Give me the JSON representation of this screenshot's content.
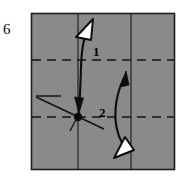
{
  "figure": {
    "step_number": "6",
    "paper": {
      "fill_color": "#8a8a8a",
      "border_color": "#1a1a1a",
      "x": 31,
      "y": 13,
      "width": 144,
      "height": 157
    },
    "crease_lines": {
      "horizontal_dashed": [
        {
          "name": "upper-crease",
          "y": 60
        },
        {
          "name": "lower-crease",
          "y": 117
        }
      ],
      "vertical_solid": [
        {
          "name": "center-vertical-crease",
          "x": 78
        },
        {
          "name": "right-vertical-crease",
          "x": 131
        }
      ],
      "short_horizontal": {
        "name": "reference-tick",
        "x1": 36,
        "x2": 61,
        "y": 96
      },
      "diagonal": {
        "name": "diagonal-crease",
        "x1": 36,
        "y1": 97,
        "x2": 103,
        "y2": 128
      }
    },
    "pivot_dot": {
      "name": "fold-pivot-point",
      "cx": 78,
      "cy": 117,
      "r": 4.2
    },
    "arrows": [
      {
        "id": "arrow-1",
        "label": "1",
        "label_x": 93,
        "label_y": 56,
        "direction": "down",
        "head_style": "hollow-triangle-top",
        "description": "curved fold arrow from upper area down to pivot point"
      },
      {
        "id": "arrow-2",
        "label": "2",
        "label_x": 103,
        "label_y": 116,
        "direction": "up",
        "head_style": "hollow-triangle-bottom",
        "description": "curved fold arrow from lower right up past the upper crease"
      }
    ],
    "colors": {
      "paper_gray": "#8a8a8a",
      "ink_black": "#101010",
      "arrowhead_fill": "#ffffff"
    }
  }
}
